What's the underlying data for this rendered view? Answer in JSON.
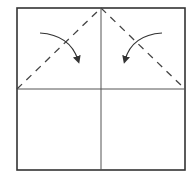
{
  "diagram": {
    "type": "origami-fold-instruction",
    "canvas": {
      "width": 192,
      "height": 184,
      "background": "#ffffff"
    },
    "colors": {
      "outline": "#333333",
      "crease": "#555555",
      "fold_line": "#444444",
      "arrow": "#333333"
    },
    "square": {
      "x": 17,
      "y": 8,
      "width": 168,
      "height": 162
    },
    "crease_lines": [
      {
        "name": "vertical-center-crease",
        "x1": 101,
        "y1": 8,
        "x2": 101,
        "y2": 170
      },
      {
        "name": "horizontal-center-crease",
        "x1": 17,
        "y1": 89,
        "x2": 185,
        "y2": 89
      }
    ],
    "valley_folds": [
      {
        "name": "left-valley-fold",
        "x1": 17,
        "y1": 89,
        "x2": 101,
        "y2": 8
      },
      {
        "name": "right-valley-fold",
        "x1": 101,
        "y1": 8,
        "x2": 185,
        "y2": 89
      }
    ],
    "fold_arrows": [
      {
        "name": "left-fold-arrow",
        "direction": "fold-corner-down-right",
        "path": "M40,33 Q70,35 78,60"
      },
      {
        "name": "right-fold-arrow",
        "direction": "fold-corner-down-left",
        "path": "M162,33 Q132,35 125,60"
      }
    ]
  }
}
